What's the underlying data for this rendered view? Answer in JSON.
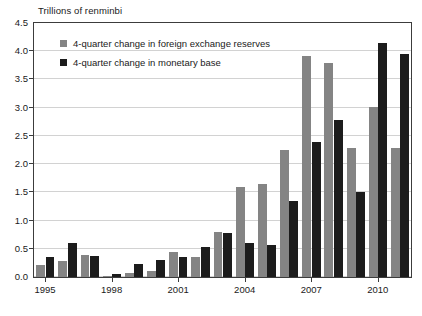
{
  "chart_data": {
    "type": "bar",
    "title": "Trillions of renminbi",
    "xlabel": "",
    "ylabel": "",
    "ylim": [
      0.0,
      4.5
    ],
    "ytick_labels": [
      "4.5",
      "4.0",
      "3.5",
      "3.0",
      "2.5",
      "2.0",
      "1.5",
      "1.0",
      "0.5",
      "0.0"
    ],
    "ytick_values": [
      4.5,
      4.0,
      3.5,
      3.0,
      2.5,
      2.0,
      1.5,
      1.0,
      0.5,
      0.0
    ],
    "grid": true,
    "legend_position": "upper-left-inside",
    "categories": [
      "1995",
      "1996",
      "1997",
      "1998",
      "1999",
      "2000",
      "2001",
      "2002",
      "2003",
      "2004",
      "2005",
      "2006",
      "2007",
      "2008",
      "2009",
      "2010",
      "2011"
    ],
    "xtick_labels": [
      "1995",
      "1998",
      "2001",
      "2004",
      "2007",
      "2010"
    ],
    "xtick_categories": [
      "1995",
      "1998",
      "2001",
      "2004",
      "2007",
      "2010"
    ],
    "series": [
      {
        "name": "4-quarter change in foreign exchange reserves",
        "color": "#848484",
        "values": [
          0.22,
          0.28,
          0.39,
          0.01,
          0.07,
          0.11,
          0.44,
          0.35,
          0.79,
          1.59,
          1.65,
          2.25,
          3.92,
          3.79,
          2.29,
          3.02,
          2.28
        ]
      },
      {
        "name": "4-quarter change in monetary base",
        "color": "#1c1c1c",
        "values": [
          0.35,
          0.61,
          0.38,
          0.06,
          0.23,
          0.3,
          0.35,
          0.54,
          0.78,
          0.61,
          0.56,
          1.35,
          2.4,
          2.78,
          1.5,
          4.15,
          3.95
        ]
      }
    ]
  },
  "legend": {
    "items": [
      {
        "label": "4-quarter change in foreign exchange reserves",
        "swatch": "reserves"
      },
      {
        "label": "4-quarter change in monetary base",
        "swatch": "base"
      }
    ]
  },
  "colors": {
    "reserves": "#848484",
    "base": "#1c1c1c",
    "gridline": "#d2d2d2",
    "frame": "#3c3c3c",
    "background": "#ffffff"
  }
}
